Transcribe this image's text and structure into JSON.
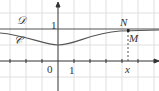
{
  "figure": {
    "line_label": "𝒟",
    "curve_label": "𝒞",
    "y_tick": "1",
    "x_tick": "1",
    "origin": "0",
    "point_N": "N",
    "point_M": "M",
    "x_label": "x",
    "colors": {
      "grid": "#dcdcdc",
      "axis": "#333333",
      "curve": "#555555"
    }
  }
}
